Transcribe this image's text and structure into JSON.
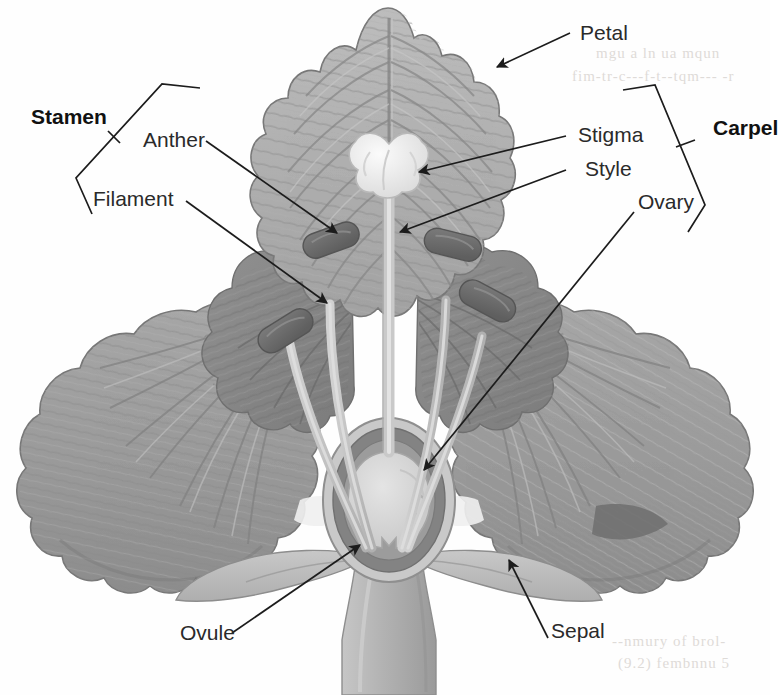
{
  "diagram": {
    "background_color": "#fefefe",
    "labels": {
      "stamen": "Stamen",
      "anther": "Anther",
      "filament": "Filament",
      "petal": "Petal",
      "stigma": "Stigma",
      "style": "Style",
      "ovary": "Ovary",
      "carpel": "Carpel",
      "ovule": "Ovule",
      "sepal": "Sepal"
    },
    "groups": [
      {
        "name": "Stamen",
        "parts": [
          "Anther",
          "Filament"
        ],
        "side": "left"
      },
      {
        "name": "Carpel",
        "parts": [
          "Stigma",
          "Style",
          "Ovary"
        ],
        "side": "right"
      }
    ],
    "colors": {
      "petal_fill": "#9d9d9d",
      "petal_dark": "#7e7e7e",
      "petal_light": "#b4b4b4",
      "vein": "#8a8a8a",
      "anther": "#6e6e6e",
      "filament": "#c3c3c3",
      "stigma": "#efefef",
      "ovary_wall": "#7d7d7d",
      "ovule": "#d8d8d8",
      "sepal": "#b8b8b8",
      "stem": "#b0b0b0",
      "leader_line": "#1c1c1c",
      "label_text": "#2a2a2a",
      "bleed_through": "#dedbd8"
    },
    "bleed_through_text": [
      "mgu a ln ua  mqun",
      "fim-tr-c---f-t--tqm--- -r",
      "--nmury of brol-",
      "(9.2)  fembnnu  5"
    ]
  }
}
